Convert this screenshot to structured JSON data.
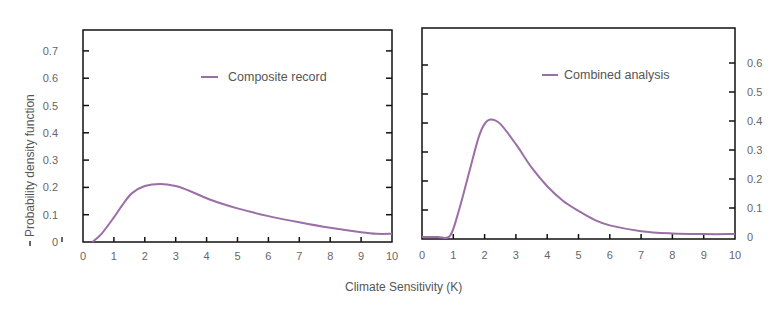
{
  "chart_data": [
    {
      "type": "line",
      "panel": "left",
      "title": "",
      "xlabel": "Climate Sensitivity (K)",
      "ylabel": "Probability density function",
      "xlim": [
        0,
        10
      ],
      "ylim": [
        0,
        0.75
      ],
      "x_ticks": [
        "0",
        "1",
        "2",
        "3",
        "4",
        "5",
        "6",
        "7",
        "8",
        "9",
        "10"
      ],
      "y_ticks": [
        "0",
        "0.1",
        "0.2",
        "0.3",
        "0.4",
        "0.5",
        "0.6",
        "0.7"
      ],
      "y_axis_side": "left",
      "grid": false,
      "legend": {
        "position": "upper-right",
        "entries": [
          "Composite record"
        ]
      },
      "series": [
        {
          "name": "Composite record",
          "color": "#9b6fa6",
          "x": [
            0.3,
            0.6,
            1.0,
            1.3,
            1.6,
            2.0,
            2.5,
            3.0,
            3.5,
            4.0,
            4.5,
            5.0,
            6.0,
            7.0,
            8.0,
            9.0,
            9.5,
            10.0
          ],
          "y": [
            0.0,
            0.03,
            0.09,
            0.14,
            0.18,
            0.205,
            0.213,
            0.205,
            0.185,
            0.16,
            0.14,
            0.123,
            0.095,
            0.072,
            0.052,
            0.036,
            0.03,
            0.03
          ]
        }
      ]
    },
    {
      "type": "line",
      "panel": "right",
      "title": "",
      "xlabel": "Climate Sensitivity (K)",
      "ylabel": "",
      "xlim": [
        0,
        10
      ],
      "ylim": [
        0,
        0.7
      ],
      "x_ticks": [
        "0",
        "1",
        "2",
        "3",
        "4",
        "5",
        "6",
        "7",
        "8",
        "9",
        "10"
      ],
      "y_ticks": [
        "0",
        "0.1",
        "0.2",
        "0.3",
        "0.4",
        "0.5",
        "0.6"
      ],
      "y_axis_side": "right",
      "grid": false,
      "legend": {
        "position": "upper-right",
        "entries": [
          "Combined analysis"
        ]
      },
      "series": [
        {
          "name": "Combined analysis",
          "color": "#9b6fa6",
          "x": [
            0.0,
            0.5,
            0.9,
            1.2,
            1.5,
            1.8,
            2.0,
            2.2,
            2.5,
            3.0,
            3.5,
            4.0,
            4.5,
            5.0,
            5.5,
            6.0,
            7.0,
            8.0,
            9.0,
            10.0
          ],
          "y": [
            0.0,
            0.0,
            0.005,
            0.1,
            0.22,
            0.34,
            0.39,
            0.405,
            0.39,
            0.32,
            0.24,
            0.175,
            0.125,
            0.09,
            0.06,
            0.04,
            0.02,
            0.012,
            0.01,
            0.01
          ]
        }
      ]
    }
  ],
  "labels": {
    "ylabel": "Probability density function",
    "xlabel": "Climate Sensitivity (K)",
    "legend_left": "Composite record",
    "legend_right": "Combined analysis"
  },
  "colors": {
    "curve": "#9b6fa6",
    "axis": "#111111",
    "text": "#666666"
  }
}
